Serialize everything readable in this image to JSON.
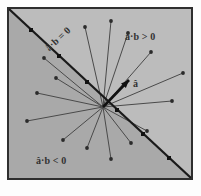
{
  "figure": {
    "background_color": "#ffffff",
    "frame_border_color": "#2e2e2e",
    "region_positive_color": "#b9b9b9",
    "region_negative_color": "#a8a8a8",
    "vector_color": "#4a4a4a",
    "boundary_color": "#1a1a1a",
    "highlight_vector_color": "#111111"
  },
  "labels": {
    "positive_region": "â·b > 0",
    "negative_region": "â·b < 0",
    "boundary_line": "â·b = 0",
    "unit_vector": "â"
  },
  "chart_data": {
    "type": "scatter",
    "xlabel": "",
    "ylabel": "",
    "xlim": [
      -100,
      100
    ],
    "ylim": [
      -100,
      100
    ],
    "grid": false,
    "legend": "none",
    "origin": {
      "x": 96,
      "y": 100
    },
    "boundary": {
      "label": "â·b = 0",
      "from": {
        "x": 2,
        "y": 2
      },
      "to": {
        "x": 184,
        "y": 171
      },
      "marker_points": [
        {
          "x": 24,
          "y": 23
        },
        {
          "x": 52,
          "y": 49
        },
        {
          "x": 80,
          "y": 75
        },
        {
          "x": 110,
          "y": 103
        },
        {
          "x": 136,
          "y": 127
        },
        {
          "x": 162,
          "y": 151
        }
      ]
    },
    "unit_vector": {
      "label": "â",
      "from": {
        "x": 96,
        "y": 100
      },
      "to": {
        "x": 122,
        "y": 73
      },
      "style": "thick-arrow"
    },
    "vectors": [
      {
        "id": "b1",
        "to": {
          "x": 78,
          "y": 20
        },
        "region": "positive"
      },
      {
        "id": "b2",
        "to": {
          "x": 104,
          "y": 14
        },
        "region": "positive"
      },
      {
        "id": "b3",
        "to": {
          "x": 121,
          "y": 26
        },
        "region": "positive"
      },
      {
        "id": "b4",
        "to": {
          "x": 144,
          "y": 45
        },
        "region": "positive"
      },
      {
        "id": "b5",
        "to": {
          "x": 176,
          "y": 66
        },
        "region": "positive"
      },
      {
        "id": "b6",
        "to": {
          "x": 165,
          "y": 94
        },
        "region": "positive"
      },
      {
        "id": "b7",
        "to": {
          "x": 140,
          "y": 124
        },
        "region": "positive"
      },
      {
        "id": "b8",
        "to": {
          "x": 124,
          "y": 136
        },
        "region": "positive"
      },
      {
        "id": "b9",
        "to": {
          "x": 104,
          "y": 152
        },
        "region": "negative"
      },
      {
        "id": "b10",
        "to": {
          "x": 80,
          "y": 141
        },
        "region": "negative"
      },
      {
        "id": "b11",
        "to": {
          "x": 56,
          "y": 133
        },
        "region": "negative"
      },
      {
        "id": "b12",
        "to": {
          "x": 20,
          "y": 114
        },
        "region": "negative"
      },
      {
        "id": "b13",
        "to": {
          "x": 30,
          "y": 86
        },
        "region": "negative"
      },
      {
        "id": "b14",
        "to": {
          "x": 49,
          "y": 71
        },
        "region": "negative"
      },
      {
        "id": "b15",
        "to": {
          "x": 37,
          "y": 51
        },
        "region": "negative"
      }
    ]
  }
}
